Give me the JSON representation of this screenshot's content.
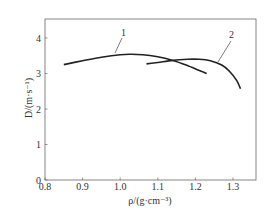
{
  "chart_data": {
    "type": "line",
    "title": "",
    "xlabel": "ρ/(g·cm⁻³)",
    "ylabel": "D/(m·s⁻¹)",
    "xlim": [
      0.8,
      1.36
    ],
    "ylim": [
      0,
      4.5
    ],
    "x_ticks": [
      "0.8",
      "0.9",
      "1.0",
      "1.1",
      "1.2",
      "1.3"
    ],
    "x_tick_values": [
      0.8,
      0.9,
      1.0,
      1.1,
      1.2,
      1.3
    ],
    "y_ticks": [
      "0",
      "1",
      "2",
      "3",
      "4"
    ],
    "y_tick_values": [
      0,
      1,
      2,
      3,
      4
    ],
    "grid": false,
    "legend": "none (curves labeled inline with leader lines)",
    "series": [
      {
        "name": "1",
        "x": [
          0.85,
          0.9,
          0.95,
          1.0,
          1.03,
          1.06,
          1.1,
          1.14,
          1.18,
          1.23
        ],
        "y": [
          3.25,
          3.36,
          3.46,
          3.53,
          3.54,
          3.53,
          3.47,
          3.37,
          3.22,
          3.0
        ]
      },
      {
        "name": "2",
        "x": [
          1.07,
          1.1,
          1.14,
          1.18,
          1.21,
          1.24,
          1.27,
          1.29,
          1.31,
          1.32
        ],
        "y": [
          3.27,
          3.31,
          3.37,
          3.4,
          3.4,
          3.36,
          3.24,
          3.07,
          2.8,
          2.57
        ]
      }
    ],
    "annotations": [
      {
        "text": "1",
        "points_to_series": "1",
        "at_x": 0.98,
        "at_y": 3.53
      },
      {
        "text": "2",
        "points_to_series": "2",
        "at_x": 1.25,
        "at_y": 3.32
      }
    ]
  },
  "labels": {
    "x_axis_title": "ρ/(g·cm⁻³)",
    "y_axis_title": "D/(m·s⁻¹)",
    "curve1": "1",
    "curve2": "2"
  },
  "colors": {
    "line": "#222222",
    "axis": "#555555",
    "text": "#333333"
  }
}
